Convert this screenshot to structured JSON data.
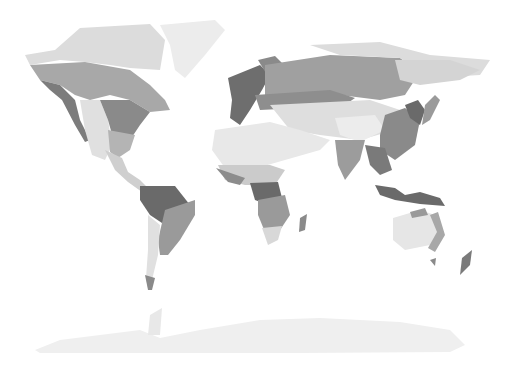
{
  "map": {
    "type": "world-biome-map",
    "style": "grayscale",
    "colors": {
      "background": "#ffffff",
      "ice": "#ececec",
      "tundra": "#dcdcdc",
      "desert": "#e6e6e6",
      "steppe": "#cfcfcf",
      "savanna": "#b4b4b4",
      "temperate": "#9a9a9a",
      "boreal": "#a8a8a8",
      "forest": "#7c7c7c",
      "rainforest": "#6a6a6a"
    }
  }
}
